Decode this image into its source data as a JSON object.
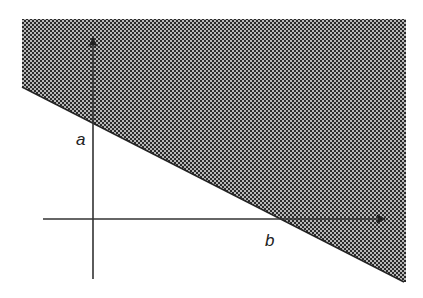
{
  "diagram": {
    "type": "half-plane inequality region",
    "labels": {
      "y_intercept": "a",
      "x_intercept": "b"
    },
    "colors": {
      "background": "#ffffff",
      "shade_dark": "#2a2a2a",
      "shade_light": "#b8b8b8",
      "axis": "#333333"
    }
  }
}
